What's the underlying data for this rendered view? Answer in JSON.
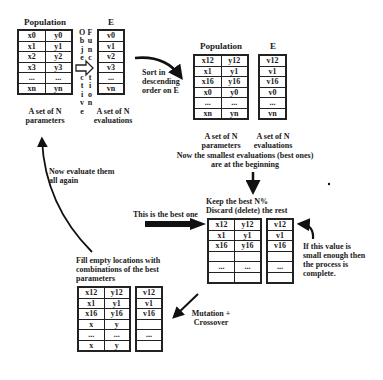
{
  "stage1": {
    "population_title": "Population",
    "e_title": "E",
    "population_rows": [
      [
        "x0",
        "y0"
      ],
      [
        "x1",
        "y1"
      ],
      [
        "x2",
        "y2"
      ],
      [
        "x3",
        "y3"
      ],
      [
        "...",
        "..."
      ],
      [
        "xn",
        "yn"
      ]
    ],
    "e_rows": [
      "v0",
      "v1",
      "v2",
      "v3",
      "...",
      "vn"
    ],
    "population_caption": [
      "A set of N",
      "parameters"
    ],
    "e_caption": [
      "A set of N",
      "evaluations"
    ],
    "objective_letters": [
      "O",
      "b",
      "j",
      "e",
      "",
      "c",
      "t",
      "i",
      "v",
      "e"
    ],
    "function_letters": [
      "F",
      "u",
      "n",
      "c",
      "",
      "t",
      "i",
      "o",
      "n"
    ]
  },
  "sort_label": [
    "Sort in",
    "descending",
    "order on E"
  ],
  "stage2": {
    "population_title": "Population",
    "e_title": "E",
    "population_rows": [
      [
        "x12",
        "y12"
      ],
      [
        "x1",
        "y1"
      ],
      [
        "x16",
        "y16"
      ],
      [
        "x0",
        "y0"
      ],
      [
        "...",
        "..."
      ],
      [
        "xn",
        "yn"
      ]
    ],
    "e_rows": [
      "v12",
      "v1",
      "v16",
      "v0",
      "...",
      "vn"
    ],
    "population_caption": [
      "A set of N",
      "parameters"
    ],
    "e_caption": [
      "A set of N",
      "evaluations"
    ],
    "note": [
      "Now the smallest evaluations (best ones)",
      "are at the beginning"
    ]
  },
  "stage3": {
    "title": [
      "Keep the best N%",
      "Discard (delete) the rest"
    ],
    "best_label": "This is the best one",
    "population_rows": [
      [
        "x12",
        "y12"
      ],
      [
        "x1",
        "y1"
      ],
      [
        "x16",
        "y16"
      ],
      [
        "",
        ""
      ],
      [
        "...",
        "..."
      ],
      [
        "",
        ""
      ]
    ],
    "e_rows": [
      "v12",
      "v1",
      "v16",
      "",
      "...",
      ""
    ],
    "stop_note": [
      "If this value is",
      "small enough then",
      "the process is",
      "complete."
    ]
  },
  "mutation_label": [
    "Mutation  +",
    "Crossover"
  ],
  "stage4": {
    "title": [
      "Fill empty locations with",
      "combinations of the best",
      "parameters"
    ],
    "population_rows": [
      [
        "x12",
        "y12"
      ],
      [
        "x1",
        "y1"
      ],
      [
        "x16",
        "y16"
      ],
      [
        "x",
        "y"
      ],
      [
        "...",
        "..."
      ],
      [
        "x",
        "y"
      ]
    ],
    "e_rows": [
      "v12",
      "v1",
      "v16",
      "",
      "...",
      ""
    ]
  },
  "loop_label": [
    "Now evaluate them",
    "all again"
  ]
}
